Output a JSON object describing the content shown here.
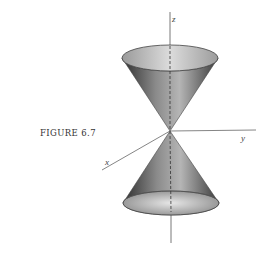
{
  "figure": {
    "caption": "FIGURE 6.7",
    "axes": {
      "z_label": "z",
      "x_label": "x",
      "y_label": "y"
    },
    "colors": {
      "background": "#ffffff",
      "line": "#555555",
      "cone_dark": "#3a3a3a",
      "cone_light": "#d8d8d8"
    }
  }
}
